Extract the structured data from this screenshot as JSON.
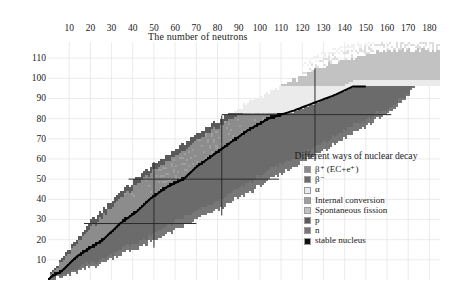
{
  "axes": {
    "x_title": "The number of neutrons",
    "y_title": "The number of protons",
    "x_ticks": [
      10,
      20,
      30,
      40,
      50,
      60,
      70,
      80,
      90,
      100,
      110,
      120,
      130,
      140,
      150,
      160,
      170,
      180
    ],
    "y_ticks": [
      10,
      20,
      30,
      40,
      50,
      60,
      70,
      80,
      90,
      100,
      110
    ]
  },
  "legend": {
    "title": "Different ways of nuclear decay",
    "items": [
      {
        "label": "β⁺ (EC+e⁺)",
        "color": "#8c8c8c"
      },
      {
        "label": "β⁻",
        "color": "#6b6b6b"
      },
      {
        "label": "α",
        "color": "#ebebeb"
      },
      {
        "label": "Internal conversion",
        "color": "#9e9e9e"
      },
      {
        "label": "Spontaneous fission",
        "color": "#c2c2c2"
      },
      {
        "label": "p",
        "color": "#5a5a5a"
      },
      {
        "label": "n",
        "color": "#777777"
      },
      {
        "label": "stable nucleus",
        "color": "#101010"
      }
    ]
  },
  "chart_data": {
    "type": "heatmap",
    "title": "",
    "xlabel": "The number of neutrons",
    "ylabel": "The number of protons",
    "xlim": [
      0,
      185
    ],
    "ylim": [
      0,
      118
    ],
    "grid": true,
    "legend_position": "lower-right",
    "magic_numbers": {
      "proton_lines_Z": [
        28,
        50,
        82
      ],
      "neutron_lines_N": [
        50,
        82,
        126
      ]
    },
    "bands": {
      "comment": "Nuclide chart bands as polylines in (N,Z) data coords: stable valley plus proton-rich and neutron-rich drip-line envelopes.",
      "stable_line": [
        [
          0,
          0
        ],
        [
          2,
          2
        ],
        [
          6,
          4
        ],
        [
          10,
          8
        ],
        [
          14,
          12
        ],
        [
          20,
          16
        ],
        [
          26,
          20
        ],
        [
          30,
          24
        ],
        [
          34,
          28
        ],
        [
          42,
          34
        ],
        [
          48,
          40
        ],
        [
          56,
          46
        ],
        [
          64,
          50
        ],
        [
          70,
          56
        ],
        [
          78,
          62
        ],
        [
          86,
          68
        ],
        [
          94,
          74
        ],
        [
          104,
          80
        ],
        [
          116,
          84
        ],
        [
          126,
          88
        ],
        [
          136,
          92
        ],
        [
          144,
          96
        ]
      ],
      "proton_rich_edge": [
        [
          0,
          1
        ],
        [
          2,
          4
        ],
        [
          5,
          8
        ],
        [
          8,
          13
        ],
        [
          12,
          18
        ],
        [
          16,
          23
        ],
        [
          21,
          29
        ],
        [
          26,
          34
        ],
        [
          31,
          40
        ],
        [
          38,
          46
        ],
        [
          44,
          52
        ],
        [
          52,
          58
        ],
        [
          60,
          64
        ],
        [
          68,
          70
        ],
        [
          76,
          76
        ],
        [
          86,
          82
        ],
        [
          96,
          88
        ],
        [
          108,
          94
        ],
        [
          120,
          100
        ],
        [
          132,
          106
        ],
        [
          146,
          110
        ],
        [
          158,
          113
        ]
      ],
      "neutron_rich_edge": [
        [
          2,
          0
        ],
        [
          8,
          2
        ],
        [
          16,
          5
        ],
        [
          24,
          8
        ],
        [
          32,
          12
        ],
        [
          42,
          16
        ],
        [
          52,
          21
        ],
        [
          62,
          26
        ],
        [
          72,
          31
        ],
        [
          82,
          36
        ],
        [
          92,
          42
        ],
        [
          102,
          48
        ],
        [
          112,
          54
        ],
        [
          122,
          60
        ],
        [
          132,
          66
        ],
        [
          142,
          72
        ],
        [
          152,
          78
        ],
        [
          162,
          84
        ],
        [
          170,
          92
        ],
        [
          176,
          100
        ],
        [
          180,
          108
        ]
      ],
      "alpha_region_start_Z": 83,
      "sf_region_start_Z": 96
    }
  }
}
